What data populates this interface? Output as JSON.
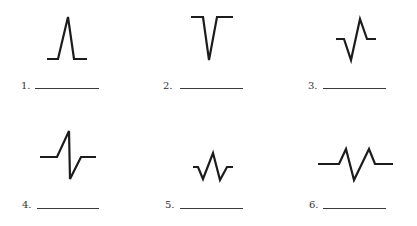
{
  "figure": {
    "title": "",
    "items": [
      {
        "number": "1.",
        "shape": "upright-spike",
        "answer": ""
      },
      {
        "number": "2.",
        "shape": "inverted-spike",
        "answer": ""
      },
      {
        "number": "3.",
        "shape": "biphasic-negative-first",
        "answer": ""
      },
      {
        "number": "4.",
        "shape": "biphasic-positive-first",
        "answer": ""
      },
      {
        "number": "5.",
        "shape": "triphasic-small",
        "answer": ""
      },
      {
        "number": "6.",
        "shape": "polyphasic-wide",
        "answer": ""
      }
    ]
  },
  "colors": {
    "stroke": "#1c1c1c",
    "background": "#ffffff",
    "answer_line": "#3a3a3a"
  }
}
